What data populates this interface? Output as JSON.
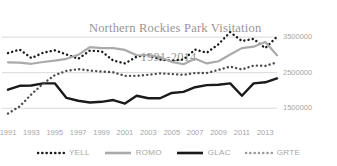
{
  "chart_data": {
    "type": "line",
    "title": "Northern Rockies Park Visitation",
    "subtitle": "1991-2014",
    "title_line1": "Northern Rockies Park Visitation",
    "title_line2": "1991-2014",
    "xlabel": "",
    "ylabel": "",
    "grid": true,
    "legend_position": "bottom",
    "ylim": [
      1000000,
      3700000
    ],
    "yticks": [
      1500000,
      2500000,
      3500000
    ],
    "ytick_labels": [
      "1500000",
      "2500000",
      "3500000"
    ],
    "x": [
      1991,
      1992,
      1993,
      1994,
      1995,
      1996,
      1997,
      1998,
      1999,
      2000,
      2001,
      2002,
      2003,
      2004,
      2005,
      2006,
      2007,
      2008,
      2009,
      2010,
      2011,
      2012,
      2013,
      2014
    ],
    "xtick_labels": [
      "1991",
      "1993",
      "1995",
      "1997",
      "1999",
      "2001",
      "2003",
      "2005",
      "2007",
      "2009",
      "2011",
      "2013"
    ],
    "xticks": [
      1991,
      1993,
      1995,
      1997,
      1999,
      2001,
      2003,
      2005,
      2007,
      2009,
      2011,
      2013
    ],
    "series": [
      {
        "name": "YELL",
        "style": "dotted",
        "color": "#1a1a1a",
        "values": [
          3050000,
          3150000,
          2910000,
          3060000,
          3130000,
          3010000,
          2890000,
          3120000,
          3100000,
          2840000,
          2760000,
          2950000,
          3000000,
          2870000,
          2840000,
          2870000,
          3150000,
          3060000,
          3300000,
          3640000,
          3390000,
          3450000,
          3190000,
          3510000
        ]
      },
      {
        "name": "ROMO",
        "style": "solid",
        "color": "#aaaaaa",
        "values": [
          2790000,
          2780000,
          2750000,
          2800000,
          2840000,
          2890000,
          3000000,
          3220000,
          3190000,
          3190000,
          3140000,
          2990000,
          2990000,
          2940000,
          2800000,
          2740000,
          2890000,
          2760000,
          2820000,
          3010000,
          3190000,
          3230000,
          3360000,
          2990000
        ]
      },
      {
        "name": "GLAC",
        "style": "solid",
        "color": "#1a1a1a",
        "values": [
          2020000,
          2130000,
          2140000,
          2200000,
          2200000,
          1790000,
          1710000,
          1660000,
          1680000,
          1730000,
          1630000,
          1850000,
          1780000,
          1780000,
          1930000,
          1960000,
          2090000,
          2150000,
          2160000,
          2200000,
          1850000,
          2200000,
          2230000,
          2340000
        ]
      },
      {
        "name": "GRTE",
        "style": "dotted",
        "color": "#4d4d4d",
        "values": [
          1350000,
          1550000,
          1890000,
          2190000,
          2430000,
          2550000,
          2600000,
          2560000,
          2530000,
          2510000,
          2410000,
          2410000,
          2440000,
          2480000,
          2460000,
          2440000,
          2490000,
          2490000,
          2580000,
          2670000,
          2590000,
          2700000,
          2690000,
          2790000
        ]
      }
    ]
  },
  "legend": {
    "items": [
      {
        "label": "YELL",
        "marker": "dotted-line-dark",
        "color": "#1a1a1a"
      },
      {
        "label": "ROMO",
        "marker": "solid-line-gray",
        "color": "#aaaaaa"
      },
      {
        "label": "GLAC",
        "marker": "solid-line-black",
        "color": "#1a1a1a"
      },
      {
        "label": "GRTE",
        "marker": "dotted-line-gray",
        "color": "#9a9a9a"
      }
    ]
  },
  "colors": {
    "gridline": "#d9d9d9",
    "text": "#a6a6a6",
    "title": "#969696",
    "background": "#ffffff"
  }
}
